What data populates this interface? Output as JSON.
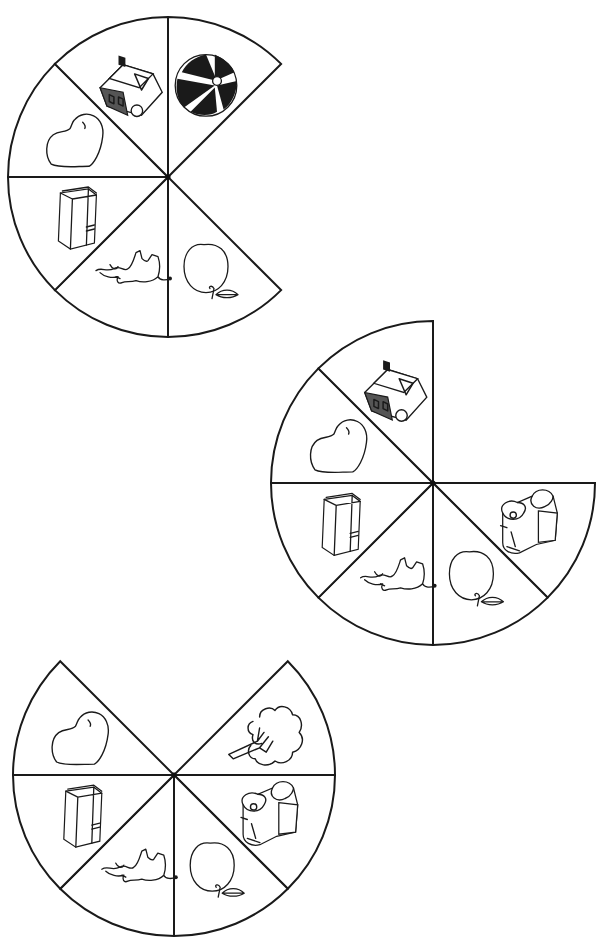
{
  "page": {
    "background": "#ffffff",
    "line_color": "#1a1a1a",
    "segment_angle_deg": 45
  },
  "wheels": [
    {
      "id": "wheel-1",
      "center": [
        168,
        177
      ],
      "radius": 160,
      "segments": [
        {
          "picture": "ball",
          "start": -90,
          "end": -45
        },
        {
          "picture": "apple",
          "start": 45,
          "end": 90
        },
        {
          "picture": "elephant",
          "start": 90,
          "end": 135
        },
        {
          "picture": "book",
          "start": 135,
          "end": 180
        },
        {
          "picture": "heart",
          "start": 180,
          "end": 225
        },
        {
          "picture": "house",
          "start": 225,
          "end": 270
        }
      ]
    },
    {
      "id": "wheel-2",
      "center": [
        433,
        483
      ],
      "radius": 162,
      "segments": [
        {
          "picture": "backpack",
          "start": 0,
          "end": 45
        },
        {
          "picture": "apple",
          "start": 45,
          "end": 90
        },
        {
          "picture": "elephant",
          "start": 90,
          "end": 135
        },
        {
          "picture": "book",
          "start": 135,
          "end": 180
        },
        {
          "picture": "heart",
          "start": 180,
          "end": 225
        },
        {
          "picture": "house",
          "start": 225,
          "end": 270
        }
      ]
    },
    {
      "id": "wheel-3",
      "center": [
        174,
        775
      ],
      "radius": 161,
      "segments": [
        {
          "picture": "tree",
          "start": -45,
          "end": 0
        },
        {
          "picture": "backpack",
          "start": 0,
          "end": 45
        },
        {
          "picture": "apple",
          "start": 45,
          "end": 90
        },
        {
          "picture": "elephant",
          "start": 90,
          "end": 135
        },
        {
          "picture": "book",
          "start": 135,
          "end": 180
        },
        {
          "picture": "heart",
          "start": 180,
          "end": 225
        }
      ]
    }
  ]
}
